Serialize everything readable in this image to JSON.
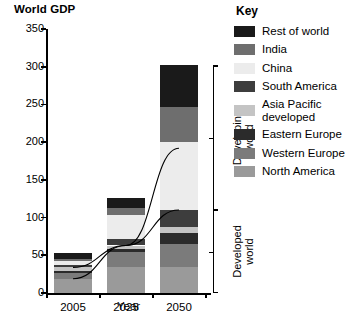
{
  "chart_data": {
    "type": "bar",
    "stacked": true,
    "title": "World GDP",
    "xlabel": "Year",
    "ylabel": "Trillion $ (PPP basis)",
    "categories": [
      "2005",
      "2025",
      "2050"
    ],
    "ylim": [
      0,
      350
    ],
    "yticks": [
      0,
      50,
      100,
      150,
      200,
      250,
      300,
      350
    ],
    "grid": false,
    "legend_position": "right",
    "legend_title": "Key",
    "totals": [
      53,
      126,
      302
    ],
    "series": [
      {
        "name": "North America",
        "color": "#9a9a9a",
        "values": [
          19,
          35,
          35
        ]
      },
      {
        "name": "Western Europe",
        "color": "#7b7b7b",
        "values": [
          7,
          20,
          30
        ]
      },
      {
        "name": "Eastern Europe",
        "color": "#2b2b2b",
        "values": [
          3,
          3,
          15
        ]
      },
      {
        "name": "Asia Pacific developed",
        "color": "#c4c4c4",
        "values": [
          5,
          5,
          8
        ]
      },
      {
        "name": "South America",
        "color": "#3d3d3d",
        "values": [
          3,
          8,
          22
        ]
      },
      {
        "name": "China",
        "color": "#ececec",
        "values": [
          5,
          32,
          90
        ]
      },
      {
        "name": "India",
        "color": "#6e6e6e",
        "values": [
          3,
          10,
          47
        ]
      },
      {
        "name": "Rest of world",
        "color": "#1a1a1a",
        "values": [
          8,
          13,
          55
        ]
      }
    ],
    "annotations": {
      "developing_bracket": "Developing world",
      "developed_bracket": "Developed world",
      "developed_line": {
        "name": "Developed world total",
        "values": [
          34,
          63,
          110
        ]
      },
      "developing_line": {
        "name": "Developing world total",
        "values": [
          19,
          63,
          192
        ]
      }
    }
  },
  "legend": {
    "title": "Key",
    "items": [
      {
        "label": "Rest of world",
        "color": "#1a1a1a"
      },
      {
        "label": "India",
        "color": "#6e6e6e"
      },
      {
        "label": "China",
        "color": "#ececec"
      },
      {
        "label": "South America",
        "color": "#3d3d3d"
      },
      {
        "label": "Asia Pacific developed",
        "color": "#c4c4c4"
      },
      {
        "label": "Eastern Europe",
        "color": "#2b2b2b"
      },
      {
        "label": "Western Europe",
        "color": "#7b7b7b"
      },
      {
        "label": "North America",
        "color": "#9a9a9a"
      }
    ]
  },
  "axes": {
    "y_title": "Trillion $ (PPP basis)",
    "x_title": "Year",
    "y_tick_labels": [
      "350",
      "300",
      "250",
      "200",
      "150",
      "100",
      "50",
      "0"
    ],
    "x_tick_labels": [
      "2005",
      "2025",
      "2050"
    ]
  },
  "brackets": {
    "developing_line1": "Developing",
    "developing_line2": "world",
    "developed_line1": "Developed",
    "developed_line2": "world"
  }
}
